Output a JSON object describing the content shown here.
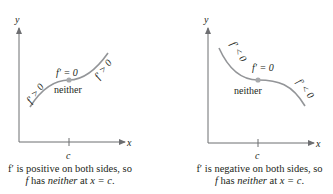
{
  "panels": [
    {
      "axis_y_label": "y",
      "axis_x_label": "x",
      "tick_label": "c",
      "point_label": "f′ = 0",
      "point_note": "neither",
      "left_slope_label": "f′ > 0",
      "right_slope_label": "f′ > 0",
      "caption_line1": "f′ is positive on both sides, so",
      "caption_line2_a": "f",
      "caption_line2_b": " has ",
      "caption_line2_c": "neither",
      "caption_line2_d": " at ",
      "caption_line2_e": "x = c",
      "caption_line2_f": "."
    },
    {
      "axis_y_label": "y",
      "axis_x_label": "x",
      "tick_label": "c",
      "point_label": "f′ = 0",
      "point_note": "neither",
      "left_slope_label": "f′ < 0",
      "right_slope_label": "f′ < 0",
      "caption_line1": "f′ is negative on both sides, so",
      "caption_line2_a": "f",
      "caption_line2_b": " has ",
      "caption_line2_c": "neither",
      "caption_line2_d": " at ",
      "caption_line2_e": "x = c",
      "caption_line2_f": "."
    }
  ],
  "colors": {
    "axis": "#6d6e71",
    "curve": "#939598",
    "point": "#a7a9ac",
    "text": "#231f20"
  }
}
